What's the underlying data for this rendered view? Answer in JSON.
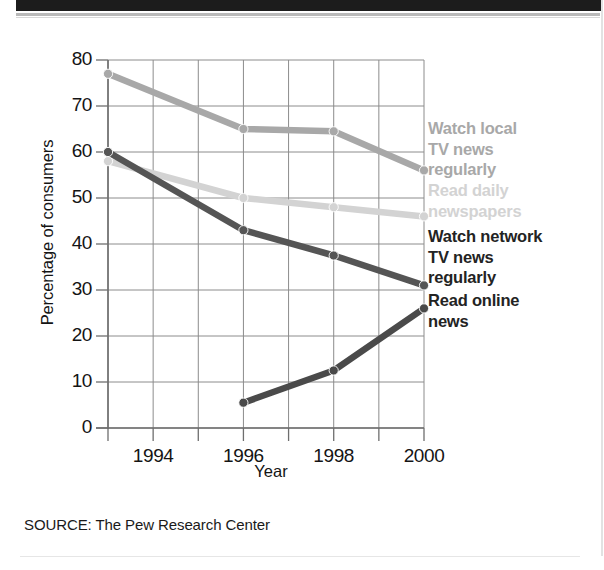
{
  "banner": {
    "present": true,
    "color": "#1c1c1c"
  },
  "chart_data": {
    "type": "line",
    "title": "",
    "subtitle": "",
    "xlabel": "Year",
    "ylabel": "Percentage of consumers",
    "xlim": [
      1993,
      2000
    ],
    "ylim": [
      0,
      80
    ],
    "grid": true,
    "legend_position": "right-inline",
    "x": [
      1993,
      1996,
      1998,
      2000
    ],
    "x_ticks": [
      1993,
      1994,
      1995,
      1996,
      1997,
      1998,
      1999,
      2000
    ],
    "x_tick_labels": [
      "",
      "1994",
      "",
      "1996",
      "",
      "1998",
      "",
      "2000"
    ],
    "y_ticks": [
      0,
      10,
      20,
      30,
      40,
      50,
      60,
      70,
      80
    ],
    "y_tick_labels": [
      "0",
      "10",
      "20",
      "30",
      "40",
      "50",
      "60",
      "70",
      "80"
    ],
    "series": [
      {
        "name": "Watch local TV news regularly",
        "color": "#a8a8a8",
        "values": [
          77,
          65,
          64.5,
          56
        ]
      },
      {
        "name": "Read daily newspapers",
        "color": "#d3d3d3",
        "values": [
          58,
          50,
          48,
          46
        ]
      },
      {
        "name": "Watch network TV news regularly",
        "color": "#555555",
        "values": [
          60,
          43,
          37.5,
          31
        ]
      },
      {
        "name": "Read online news",
        "color": "#4a4a4a",
        "values": [
          null,
          5.5,
          12.5,
          26
        ]
      }
    ]
  },
  "axis": {
    "y_title": "Percentage of consumers",
    "x_title": "Year",
    "y_labels": [
      "80",
      "70",
      "60",
      "50",
      "40",
      "30",
      "20",
      "10",
      "0"
    ],
    "x_labels": [
      "1994",
      "1996",
      "1998",
      "2000"
    ]
  },
  "legend": {
    "entries": [
      {
        "label_line1": "Watch local",
        "label_line2": "TV news",
        "label_line3": "regularly",
        "color": "#a8a8a8"
      },
      {
        "label_line1": "Read daily",
        "label_line2": "newspapers",
        "label_line3": "",
        "color": "#d3d3d3"
      },
      {
        "label_line1": "Watch network",
        "label_line2": "TV news",
        "label_line3": "regularly",
        "color": "#232323"
      },
      {
        "label_line1": "Read online",
        "label_line2": "news",
        "label_line3": "",
        "color": "#232323"
      }
    ]
  },
  "source": {
    "text": "SOURCE: The Pew Research Center"
  }
}
